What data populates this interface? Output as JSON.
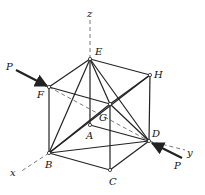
{
  "figure": {
    "nodes": [
      {
        "id": "E",
        "label": "E",
        "x": 90,
        "y": 59,
        "lx": 95,
        "ly": 55
      },
      {
        "id": "H",
        "label": "H",
        "x": 150,
        "y": 75,
        "lx": 154,
        "ly": 78
      },
      {
        "id": "F",
        "label": "F",
        "x": 49,
        "y": 87,
        "lx": 37,
        "ly": 98
      },
      {
        "id": "G",
        "label": "G",
        "x": 110,
        "y": 104,
        "lx": 99,
        "ly": 121
      },
      {
        "id": "A",
        "label": "A",
        "x": 90,
        "y": 125,
        "lx": 86,
        "ly": 139
      },
      {
        "id": "D",
        "label": "D",
        "x": 149,
        "y": 141,
        "lx": 152,
        "ly": 137
      },
      {
        "id": "B",
        "label": "B",
        "x": 49,
        "y": 153,
        "lx": 45,
        "ly": 168
      },
      {
        "id": "C",
        "label": "C",
        "x": 110,
        "y": 170,
        "lx": 109,
        "ly": 185
      }
    ],
    "members": [
      [
        "E",
        "H"
      ],
      [
        "E",
        "F"
      ],
      [
        "F",
        "G"
      ],
      [
        "G",
        "H"
      ],
      [
        "F",
        "B"
      ],
      [
        "G",
        "C"
      ],
      [
        "H",
        "D"
      ],
      [
        "B",
        "C"
      ],
      [
        "C",
        "D"
      ],
      [
        "E",
        "B"
      ],
      [
        "E",
        "G"
      ],
      [
        "E",
        "D"
      ],
      [
        "B",
        "G"
      ],
      [
        "B",
        "D"
      ],
      [
        "G",
        "D"
      ],
      [
        "B",
        "H"
      ],
      [
        "A",
        "D"
      ],
      [
        "E",
        "A"
      ]
    ],
    "axes": [
      {
        "name": "z",
        "label": "z",
        "x1": 90,
        "y1": 20,
        "x2": 90,
        "y2": 59,
        "lx": 87,
        "ly": 17
      },
      {
        "name": "x",
        "label": "x",
        "x1": 49,
        "y1": 153,
        "x2": 20,
        "y2": 172,
        "lx": 10,
        "ly": 176
      },
      {
        "name": "y",
        "label": "y",
        "x1": 149,
        "y1": 141,
        "x2": 185,
        "y2": 150,
        "lx": 187,
        "ly": 156
      }
    ],
    "hidden_lines": [
      {
        "from": "F",
        "to": "D"
      }
    ],
    "forces": [
      {
        "label": "P",
        "x1": 16,
        "y1": 70,
        "x2": 47,
        "y2": 86,
        "lx": 6,
        "ly": 70
      },
      {
        "label": "P",
        "x1": 182,
        "y1": 158,
        "x2": 152,
        "y2": 143,
        "lx": 174,
        "ly": 169
      }
    ]
  }
}
